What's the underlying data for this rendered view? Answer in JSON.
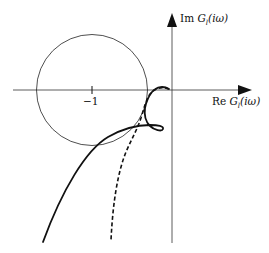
{
  "diagram": {
    "type": "nyquist-plot",
    "axes": {
      "imag_label": {
        "prefix": "Im ",
        "func": "G",
        "sub": "l",
        "arg": "(iω)"
      },
      "real_label": {
        "prefix": "Re ",
        "func": "G",
        "sub": "l",
        "arg": "(iω)"
      },
      "tick_label": "−1"
    },
    "elements": {
      "circle": {
        "center": [
          -1,
          0
        ],
        "description": "unit-radius circle centered at -1"
      },
      "curves": [
        {
          "name": "solid",
          "style": "solid"
        },
        {
          "name": "dashed",
          "style": "dashed"
        }
      ]
    },
    "colors": {
      "stroke": "#111111",
      "background": "#ffffff"
    }
  }
}
